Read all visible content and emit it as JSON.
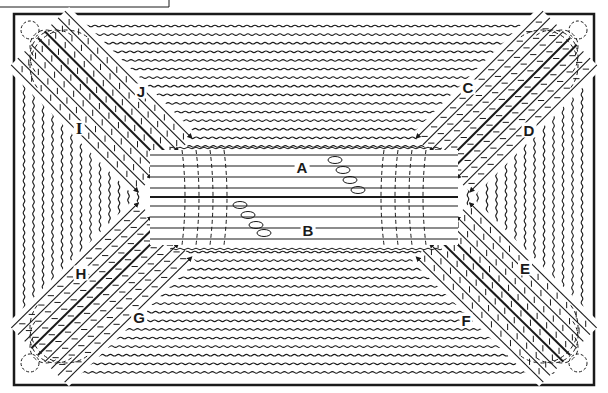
{
  "figure": {
    "caption_box_partial": "",
    "ink_color": "#1a1a1a",
    "paper_color": "#ffffff",
    "frame": {
      "x": 14,
      "y": 14,
      "width": 580,
      "height": 371
    },
    "center_channel": {
      "x1": 150,
      "x2": 458,
      "top": 150,
      "bottom": 245,
      "midline_y": 197
    },
    "labels": [
      {
        "id": "A",
        "text": "A",
        "x": 302,
        "y": 167
      },
      {
        "id": "B",
        "text": "B",
        "x": 308,
        "y": 230
      },
      {
        "id": "C",
        "text": "C",
        "x": 468,
        "y": 87
      },
      {
        "id": "D",
        "text": "D",
        "x": 529,
        "y": 130
      },
      {
        "id": "E",
        "text": "E",
        "x": 525,
        "y": 268
      },
      {
        "id": "F",
        "text": "F",
        "x": 466,
        "y": 320
      },
      {
        "id": "G",
        "text": "G",
        "x": 139,
        "y": 317
      },
      {
        "id": "H",
        "text": "H",
        "x": 81,
        "y": 273
      },
      {
        "id": "I",
        "text": "I",
        "x": 79,
        "y": 128
      },
      {
        "id": "J",
        "text": "J",
        "x": 141,
        "y": 91
      }
    ],
    "arms": [
      {
        "name": "upper-left",
        "labels": [
          "J",
          "I"
        ],
        "corner": [
          34,
          34
        ]
      },
      {
        "name": "upper-right",
        "labels": [
          "C",
          "D"
        ],
        "corner": [
          578,
          34
        ]
      },
      {
        "name": "lower-left",
        "labels": [
          "H",
          "G"
        ],
        "corner": [
          34,
          368
        ]
      },
      {
        "name": "lower-right",
        "labels": [
          "E",
          "F"
        ],
        "corner": [
          578,
          368
        ]
      }
    ]
  }
}
